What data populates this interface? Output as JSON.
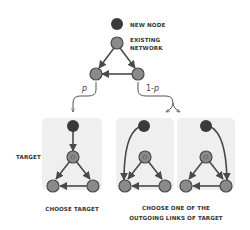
{
  "legend": {
    "new_node": "NEW NODE",
    "existing_network_line1": "EXISTING",
    "existing_network_line2": "NETWORK"
  },
  "branches": {
    "left_prob": "p",
    "right_prob_prefix": "1-",
    "right_prob_var": "p"
  },
  "labels": {
    "target": "TARGET",
    "choose_target": "CHOOSE TARGET",
    "choose_links_line1": "CHOOSE ONE OF THE",
    "choose_links_line2": "OUTGOING LINKS OF TARGET"
  },
  "colors": {
    "new_node": "#3a3a3a",
    "existing_node": "#8a8a8a",
    "edge": "#4a4a4a",
    "panel": "#efefef"
  }
}
